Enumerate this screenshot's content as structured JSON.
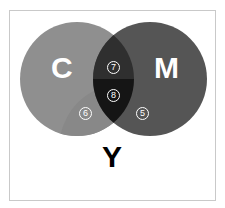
{
  "diagram": {
    "type": "venn",
    "colors": {
      "frame_border": "#c9c9c9",
      "circle_c": "#8f8f8f",
      "circle_c_shade": "#888888",
      "circle_m": "#555555",
      "overlap_upper": "#2f2f2f",
      "overlap_lower": "#151515"
    },
    "sets": {
      "c": {
        "label": "C"
      },
      "m": {
        "label": "M"
      },
      "y": {
        "label": "Y"
      }
    },
    "regions": {
      "c_y": {
        "number": "6"
      },
      "m_y": {
        "number": "5"
      },
      "c_m": {
        "number": "7"
      },
      "c_m_y": {
        "number": "8"
      }
    }
  }
}
